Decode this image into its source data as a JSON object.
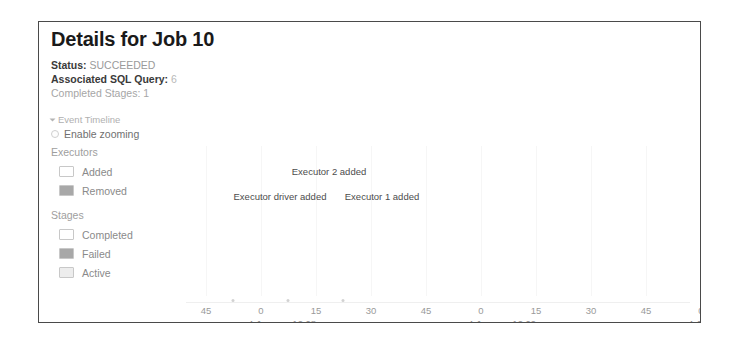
{
  "panel": {
    "title": "Details for Job 10"
  },
  "summary": [
    {
      "key": "Status:",
      "value": "SUCCEEDED",
      "bold": true,
      "link": false
    },
    {
      "key": "Associated SQL Query:",
      "value": "6",
      "bold": true,
      "link": true
    },
    {
      "key": "Completed Stages:",
      "value": "1",
      "bold": false,
      "link": false
    }
  ],
  "timeline": {
    "section_label": "Event Timeline",
    "zoom_label": "Enable zooming",
    "zoom_checked": false,
    "caret_icon": "caret-down-icon",
    "checkbox_icon": "checkbox-icon"
  },
  "legend": {
    "groups": [
      {
        "title": "Executors",
        "items": [
          {
            "label": "Added",
            "color": "#ffffff"
          },
          {
            "label": "Removed",
            "color": "#a8a8a8"
          }
        ]
      },
      {
        "title": "Stages",
        "items": [
          {
            "label": "Completed",
            "color": "#ffffff"
          },
          {
            "label": "Failed",
            "color": "#a8a8a8"
          },
          {
            "label": "Active",
            "color": "#ededed"
          }
        ]
      }
    ]
  },
  "chart_data": {
    "type": "scatter",
    "title": "Event Timeline",
    "xlabel": "",
    "ylabel": "",
    "grid": true,
    "legend_position": "left",
    "x_ticks": [
      "45",
      "0",
      "15",
      "30",
      "45",
      "0",
      "15",
      "30",
      "45",
      "0"
    ],
    "x_tick_positions": [
      20,
      75,
      130,
      185,
      240,
      295,
      350,
      405,
      460,
      515
    ],
    "date_labels": [
      {
        "text": "4 January 12:08",
        "x": 62
      },
      {
        "text": "4 January 12:09",
        "x": 282
      },
      {
        "text": "4 Janu",
        "x": 502
      }
    ],
    "events": [
      {
        "label": "Executor 2 added",
        "x": 143,
        "y": 20
      },
      {
        "label": "Executor driver added",
        "x": 94,
        "y": 45
      },
      {
        "label": "Executor 1 added",
        "x": 196,
        "y": 45
      }
    ],
    "marker_positions": [
      47,
      102,
      157
    ],
    "gridline_positions": [
      20,
      75,
      130,
      185,
      240,
      295,
      350,
      405,
      460,
      515
    ]
  }
}
